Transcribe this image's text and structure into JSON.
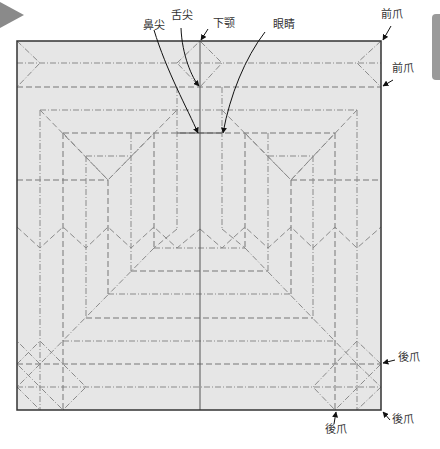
{
  "diagram": {
    "paper_fill": "#e6e6e6",
    "border_color": "#333333",
    "line_color": "#888888",
    "square": {
      "x": 17,
      "y": 41,
      "w": 364,
      "h": 369
    }
  },
  "labels": {
    "nose_tip": "鼻尖",
    "tongue_tip": "舌尖",
    "lower_jaw": "下颚",
    "eyes": "眼睛",
    "front_claw_1": "前爪",
    "front_claw_2": "前爪",
    "hind_claw_1": "後爪",
    "hind_claw_2": "後爪",
    "hind_claw_3": "後爪"
  }
}
